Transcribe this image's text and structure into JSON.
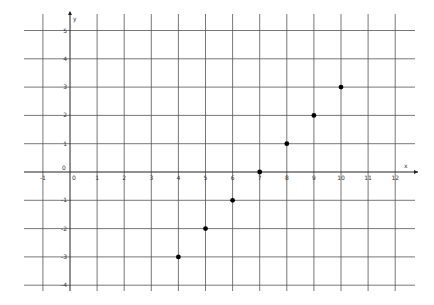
{
  "chart_data": {
    "type": "scatter",
    "title": "",
    "xlabel": "x",
    "ylabel": "y",
    "xlim": [
      -1,
      12
    ],
    "ylim": [
      -4,
      5
    ],
    "grid": true,
    "origin_label": "0",
    "x_ticks": [
      -1,
      0,
      1,
      2,
      3,
      4,
      5,
      6,
      7,
      8,
      9,
      10,
      11,
      12
    ],
    "x_tick_labels": [
      "-1",
      "0",
      "1",
      "2",
      "3",
      "4",
      "5",
      "6",
      "7",
      "8",
      "9",
      "10",
      "11",
      "12"
    ],
    "y_ticks": [
      -4,
      -3,
      -2,
      -1,
      1,
      2,
      3,
      4,
      5
    ],
    "y_tick_labels": [
      "-4",
      "-3",
      "-2",
      "-1",
      "1",
      "2",
      "3",
      "4",
      "5"
    ],
    "series": [
      {
        "name": "points",
        "x": [
          4,
          5,
          6,
          7,
          8,
          9,
          10
        ],
        "y": [
          -3,
          -2,
          -1,
          0,
          1,
          2,
          3
        ]
      }
    ]
  },
  "colors": {
    "grid": "#555555",
    "axis": "#222222",
    "point": "#000000",
    "label": "#333333"
  }
}
